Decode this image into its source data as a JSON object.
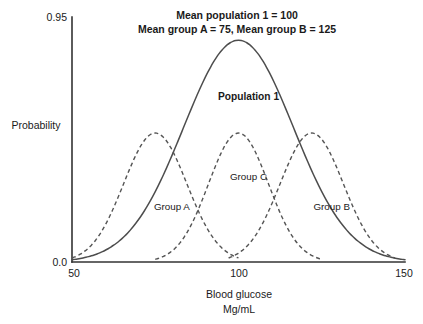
{
  "chart_data": {
    "type": "line",
    "title": "Mean population 1 = 100\nMean group A = 75, Mean group B = 125",
    "title_line1": "Mean population 1 = 100",
    "title_line2": "Mean group A = 75, Mean group B = 125",
    "xlabel": "Blood glucose",
    "xlabel_line2": "Mg/mL",
    "ylabel": "Probability",
    "xlim": [
      50,
      150
    ],
    "ylim": [
      0.0,
      0.95
    ],
    "xticks": [
      50,
      100,
      150
    ],
    "xtick_labels": [
      "50",
      "100",
      "150"
    ],
    "yticks": [
      0.0,
      0.95
    ],
    "ytick_labels": [
      "0.0",
      "0.95"
    ],
    "grid": false,
    "legend": "inline-annotations",
    "series": [
      {
        "name": "Population 1",
        "label": "Population 1",
        "style": "solid",
        "color": "#4d4d4d",
        "mean": 100,
        "sd": 16.5,
        "peak_value": 0.86,
        "label_x": 103,
        "label_y": 0.63,
        "label_bold": true,
        "x": [
          50,
          55,
          60,
          65,
          70,
          75,
          80,
          85,
          90,
          95,
          100,
          105,
          110,
          115,
          120,
          125,
          130,
          135,
          140,
          145,
          150
        ],
        "y": [
          0.01,
          0.025,
          0.06,
          0.12,
          0.22,
          0.35,
          0.5,
          0.66,
          0.78,
          0.85,
          0.86,
          0.845,
          0.79,
          0.68,
          0.55,
          0.41,
          0.28,
          0.17,
          0.09,
          0.035,
          0.005
        ]
      },
      {
        "name": "Group A",
        "label": "Group A",
        "style": "dashed",
        "color": "#555555",
        "mean": 75,
        "sd": 9.5,
        "peak_value": 0.5,
        "label_x": 80,
        "label_y": 0.2,
        "label_bold": false,
        "x": [
          50,
          55,
          60,
          65,
          70,
          75,
          80,
          85,
          90,
          95,
          100
        ],
        "y": [
          0.01,
          0.045,
          0.13,
          0.3,
          0.45,
          0.5,
          0.45,
          0.3,
          0.13,
          0.045,
          0.005
        ]
      },
      {
        "name": "Group C",
        "label": "Group C",
        "style": "dashed",
        "color": "#555555",
        "mean": 100,
        "sd": 9.0,
        "peak_value": 0.5,
        "label_x": 103,
        "label_y": 0.32,
        "label_bold": false,
        "x": [
          75,
          80,
          85,
          90,
          95,
          100,
          105,
          110,
          115,
          120,
          125
        ],
        "y": [
          0.01,
          0.045,
          0.13,
          0.3,
          0.45,
          0.5,
          0.45,
          0.3,
          0.13,
          0.045,
          0.005
        ]
      },
      {
        "name": "Group B",
        "label": "Group B",
        "style": "dashed",
        "color": "#555555",
        "mean": 122,
        "sd": 9.5,
        "peak_value": 0.5,
        "label_x": 128,
        "label_y": 0.2,
        "label_bold": false,
        "x": [
          97,
          102,
          107,
          112,
          117,
          122,
          127,
          132,
          137,
          142,
          147
        ],
        "y": [
          0.01,
          0.045,
          0.13,
          0.3,
          0.45,
          0.5,
          0.45,
          0.3,
          0.13,
          0.045,
          0.005
        ]
      }
    ]
  },
  "axes": {
    "y_axis_name": "probability-axis",
    "x_axis_name": "blood-glucose-axis"
  }
}
